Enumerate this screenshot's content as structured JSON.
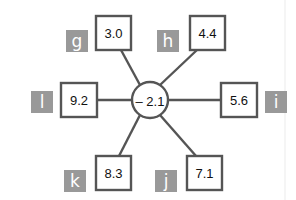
{
  "center": {
    "value": "– 2.1"
  },
  "nodes": [
    {
      "id": "g",
      "label": "g",
      "value": "3.0",
      "position": "top-left"
    },
    {
      "id": "h",
      "label": "h",
      "value": "4.4",
      "position": "top-right"
    },
    {
      "id": "l",
      "label": "l",
      "value": "9.2",
      "position": "left"
    },
    {
      "id": "i",
      "label": "i",
      "value": "5.6",
      "position": "right"
    },
    {
      "id": "k",
      "label": "k",
      "value": "8.3",
      "position": "bottom-left"
    },
    {
      "id": "j",
      "label": "j",
      "value": "7.1",
      "position": "bottom-right"
    }
  ],
  "colors": {
    "stroke": "#555555",
    "tag_fill": "#999999",
    "tag_text": "#ffffff",
    "background": "#ffffff"
  }
}
